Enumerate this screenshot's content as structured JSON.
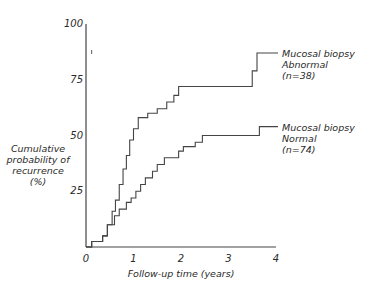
{
  "chart_data": {
    "type": "line",
    "step": true,
    "title": "",
    "xlabel": "Follow-up time (years)",
    "ylabel": "Cumulative probability of recurrence (%)",
    "ylabel_lines": [
      "Cumulative",
      "probability of",
      "recurrence",
      "(%)"
    ],
    "xlim": [
      0,
      4
    ],
    "ylim": [
      0,
      100
    ],
    "xticks": [
      0,
      1,
      2,
      3,
      4
    ],
    "xtick_labels": [
      "0",
      "1",
      "2",
      "3",
      "4"
    ],
    "yticks": [
      25,
      50,
      75,
      100
    ],
    "ytick_labels": [
      "25",
      "50",
      "75",
      "100"
    ],
    "grid": false,
    "series": [
      {
        "name": "Mucosal biopsy Abnormal (n=38)",
        "label_lines": [
          "Mucosal biopsy",
          "Abnormal",
          "(n=38)"
        ],
        "x": [
          0,
          0.12,
          0.35,
          0.45,
          0.55,
          0.62,
          0.7,
          0.78,
          0.85,
          0.92,
          1.0,
          1.1,
          1.3,
          1.5,
          1.7,
          1.85,
          1.95,
          3.5,
          3.6,
          3.65
        ],
        "y": [
          0,
          2.5,
          5,
          10,
          16,
          21,
          28,
          35,
          41,
          48,
          53,
          58,
          60,
          62,
          65,
          68,
          72,
          79,
          87,
          87
        ]
      },
      {
        "name": "Mucosal biopsy Normal (n=74)",
        "label_lines": [
          "Mucosal biopsy",
          "Normal",
          "(n=74)"
        ],
        "x": [
          0,
          0.12,
          0.35,
          0.45,
          0.6,
          0.7,
          0.85,
          0.95,
          1.05,
          1.15,
          1.25,
          1.4,
          1.5,
          1.65,
          1.95,
          2.05,
          2.3,
          2.45,
          3.65,
          3.7
        ],
        "y": [
          0,
          2.5,
          5,
          10,
          14,
          17,
          20,
          22,
          25,
          28,
          31,
          34,
          37,
          40,
          43,
          45,
          47,
          50,
          54,
          54
        ]
      }
    ]
  }
}
